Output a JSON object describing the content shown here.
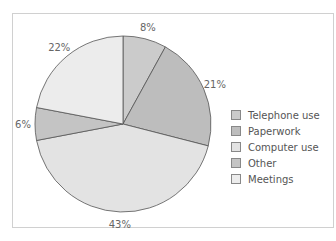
{
  "chart_data": {
    "type": "pie",
    "title": "",
    "categories": [
      "Telephone use",
      "Paperwork",
      "Computer use",
      "Other",
      "Meetings"
    ],
    "values": [
      8,
      21,
      43,
      6,
      22
    ],
    "labels": [
      "8%",
      "21%",
      "43%",
      "6%",
      "22%"
    ],
    "colors": [
      "#cbcbcb",
      "#bdbdbd",
      "#e3e3e3",
      "#c4c4c4",
      "#ececec"
    ],
    "legend_position": "right"
  }
}
